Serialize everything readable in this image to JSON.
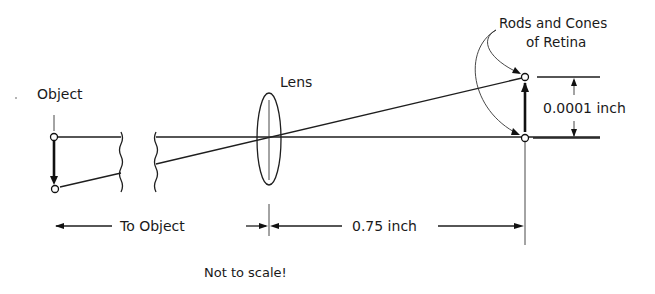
{
  "diagram": {
    "labels": {
      "object": "Object",
      "lens": "Lens",
      "retina_line1": "Rods and Cones",
      "retina_line2": "of Retina",
      "image_size": "0.0001 inch",
      "to_object": "To Object",
      "focal_distance": "0.75 inch",
      "note": "Not to scale!"
    },
    "elements": {
      "object_points": [
        {
          "x": 54,
          "y": 137
        },
        {
          "x": 55,
          "y": 189
        }
      ],
      "lens": {
        "cx": 269,
        "cy": 139,
        "rx": 12,
        "ry": 46
      },
      "retina_points": [
        {
          "x": 525,
          "y": 77
        },
        {
          "x": 525,
          "y": 138
        }
      ],
      "break_marks_x": [
        121,
        155
      ]
    },
    "colors": {
      "ink": "#1e1e1e",
      "background": "#ffffff"
    }
  }
}
